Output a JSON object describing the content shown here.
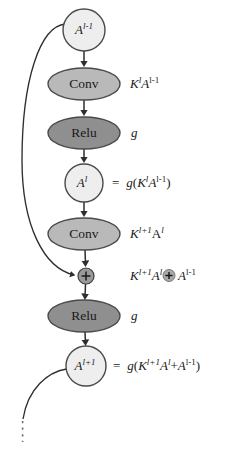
{
  "diagram": {
    "colors": {
      "background": "#ffffff",
      "circle_fill": "#eeeeee",
      "conv_fill": "#b9b9b9",
      "relu_fill": "#8f8f8f",
      "plus_fill": "#9a9a9a",
      "stroke": "#4a4a4a",
      "text": "#1a1a1a"
    },
    "nodes": [
      {
        "id": "a-prev",
        "shape": "circle",
        "label_plain": "A^{l-1}",
        "base": "A",
        "exponent": "l-1",
        "fill": "#eeeeee",
        "cx": 84,
        "cy": 30,
        "r": 21
      },
      {
        "id": "conv-1",
        "shape": "ellipse",
        "label_plain": "Conv",
        "fill": "#b9b9b9",
        "cx": 84,
        "cy": 84,
        "rx": 36,
        "ry": 16
      },
      {
        "id": "relu-1",
        "shape": "ellipse",
        "label_plain": "Relu",
        "fill": "#8f8f8f",
        "cx": 84,
        "cy": 133,
        "rx": 36,
        "ry": 16
      },
      {
        "id": "a-cur",
        "shape": "circle",
        "label_plain": "A^{l}",
        "base": "A",
        "exponent": "l",
        "fill": "#eeeeee",
        "cx": 84,
        "cy": 183,
        "r": 19
      },
      {
        "id": "conv-2",
        "shape": "ellipse",
        "label_plain": "Conv",
        "fill": "#b9b9b9",
        "cx": 84,
        "cy": 234,
        "rx": 36,
        "ry": 16
      },
      {
        "id": "add",
        "shape": "circle-plus",
        "label_plain": "+",
        "fill": "#9a9a9a",
        "cx": 86,
        "cy": 276,
        "r": 8
      },
      {
        "id": "relu-2",
        "shape": "ellipse",
        "label_plain": "Relu",
        "fill": "#8f8f8f",
        "cx": 84,
        "cy": 316,
        "rx": 36,
        "ry": 16
      },
      {
        "id": "a-next",
        "shape": "circle",
        "label_plain": "A^{l+1}",
        "base": "A",
        "exponent": "l+1",
        "fill": "#eeeeee",
        "cx": 86,
        "cy": 366,
        "r": 20
      }
    ],
    "side_labels": [
      {
        "id": "label-conv-1",
        "plain": "K^{l}A^{l-1}",
        "x": 130,
        "y": 84,
        "tokens": [
          {
            "t": "K",
            "style": "italic"
          },
          {
            "t": "l",
            "style": "sup-italic"
          },
          {
            "t": "A",
            "style": "italic"
          },
          {
            "t": "l-1",
            "style": "sup-upright"
          }
        ]
      },
      {
        "id": "label-relu-1",
        "plain": "g",
        "x": 130,
        "y": 133,
        "tokens": [
          {
            "t": "g",
            "style": "italic"
          }
        ]
      },
      {
        "id": "label-a-cur",
        "plain": "=  g(K^{l}A^{l-1})",
        "x": 112,
        "y": 183,
        "tokens": [
          {
            "t": "=",
            "style": "upright"
          },
          {
            "t": "g",
            "style": "italic"
          },
          {
            "t": "(",
            "style": "upright"
          },
          {
            "t": "K",
            "style": "italic"
          },
          {
            "t": "l",
            "style": "sup-italic"
          },
          {
            "t": "A",
            "style": "italic"
          },
          {
            "t": "l-1",
            "style": "sup-upright"
          },
          {
            "t": ")",
            "style": "upright"
          }
        ]
      },
      {
        "id": "label-conv-2",
        "plain": "K^{l+1}A^{l}",
        "x": 130,
        "y": 234,
        "tokens": [
          {
            "t": "K",
            "style": "italic"
          },
          {
            "t": "l+1",
            "style": "sup-italic"
          },
          {
            "t": "A",
            "style": "upright"
          },
          {
            "t": "l",
            "style": "sup-italic"
          }
        ]
      },
      {
        "id": "label-add",
        "plain": "K^{l+1}A^{l} ⊕ A^{l-1}",
        "x": 130,
        "y": 276,
        "tokens": [
          {
            "t": "K",
            "style": "italic"
          },
          {
            "t": "l+1",
            "style": "sup-italic"
          },
          {
            "t": "A",
            "style": "italic"
          },
          {
            "t": "l",
            "style": "sup-italic"
          },
          {
            "t": "⊕",
            "style": "circle-plus"
          },
          {
            "t": "A",
            "style": "italic"
          },
          {
            "t": "l-1",
            "style": "sup-upright"
          }
        ]
      },
      {
        "id": "label-relu-2",
        "plain": "g",
        "x": 130,
        "y": 316,
        "tokens": [
          {
            "t": "g",
            "style": "italic"
          }
        ]
      },
      {
        "id": "label-a-next",
        "plain": "=  g(K^{l+1}A^{l}+A^{l-1})",
        "x": 113,
        "y": 366,
        "tokens": [
          {
            "t": "=",
            "style": "upright"
          },
          {
            "t": "g",
            "style": "italic"
          },
          {
            "t": "(",
            "style": "upright"
          },
          {
            "t": "K",
            "style": "italic"
          },
          {
            "t": "l+1",
            "style": "sup-italic"
          },
          {
            "t": "A",
            "style": "italic"
          },
          {
            "t": "l",
            "style": "sup-italic"
          },
          {
            "t": "+",
            "style": "upright"
          },
          {
            "t": "A",
            "style": "italic"
          },
          {
            "t": "l-1",
            "style": "sup-upright"
          },
          {
            "t": ")",
            "style": "upright"
          }
        ]
      }
    ],
    "edges": [
      {
        "id": "edge-aprev-conv1",
        "from": "a-prev",
        "to": "conv-1",
        "kind": "arrow"
      },
      {
        "id": "edge-conv1-relu1",
        "from": "conv-1",
        "to": "relu-1",
        "kind": "arrow"
      },
      {
        "id": "edge-relu1-acur",
        "from": "relu-1",
        "to": "a-cur",
        "kind": "arrow"
      },
      {
        "id": "edge-acur-conv2",
        "from": "a-cur",
        "to": "conv-2",
        "kind": "arrow"
      },
      {
        "id": "edge-conv2-add",
        "from": "conv-2",
        "to": "add",
        "kind": "arrow"
      },
      {
        "id": "edge-add-relu2",
        "from": "add",
        "to": "relu-2",
        "kind": "arrow"
      },
      {
        "id": "edge-relu2-anext",
        "from": "relu-2",
        "to": "a-next",
        "kind": "arrow"
      },
      {
        "id": "skip-connection",
        "from": "a-prev",
        "to": "add",
        "kind": "curved-arrow"
      },
      {
        "id": "outgoing-connection",
        "from": "a-next",
        "to": "continuation",
        "kind": "curve-dotted"
      }
    ],
    "text_labels": {
      "conv": "Conv",
      "relu": "Relu",
      "a_prev_base": "A",
      "a_prev_sup": "l-1",
      "a_cur_base": "A",
      "a_cur_sup": "l",
      "a_next_base": "A",
      "a_next_sup": "l+1",
      "g": "g",
      "equals": "=",
      "k": "K",
      "plus": "+",
      "oplus": "⊕",
      "lparen": "(",
      "rparen": ")",
      "sup_l": "l",
      "sup_l_minus_1": "l-1",
      "sup_l_plus_1": "l+1"
    }
  }
}
